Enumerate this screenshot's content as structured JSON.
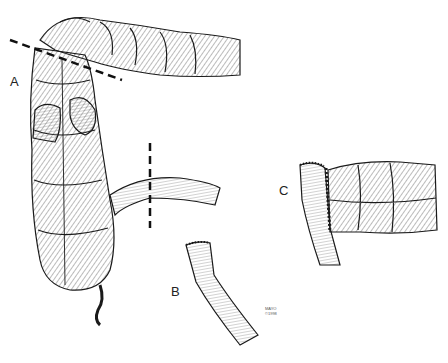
{
  "figure": {
    "panels": [
      {
        "id": "A",
        "label": "A",
        "content": "Right colon with cecum, appendix and terminal ileum; dashed resection lines across transverse colon and terminal ileum"
      },
      {
        "id": "B",
        "label": "B",
        "content": "Terminal ileum segment with stapled/sutured end"
      },
      {
        "id": "C",
        "label": "C",
        "content": "Completed end-to-side ileocolic anastomosis"
      }
    ],
    "watermark": {
      "line1": "MAYO",
      "line2": "©1998"
    },
    "colors": {
      "ink": "#1a1a1a",
      "background": "#ffffff"
    }
  }
}
